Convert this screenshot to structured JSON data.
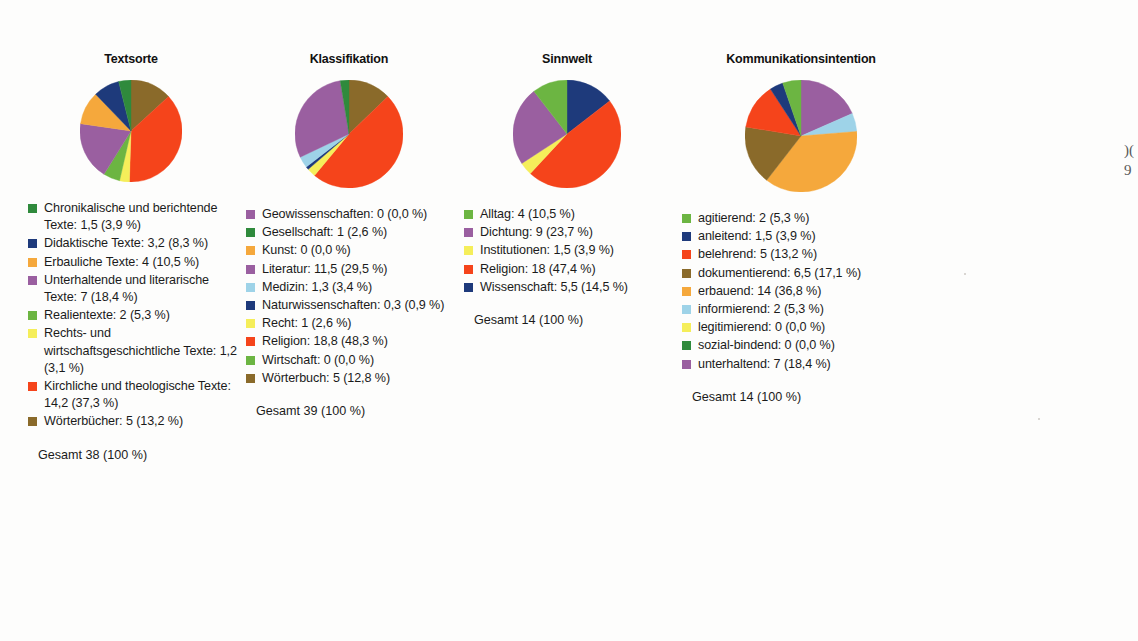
{
  "page": {
    "background_color": "#fdfdfc",
    "margin_note_line1": ")(",
    "margin_note_line2": "9"
  },
  "palette": {
    "green_dark": "#2f8a3c",
    "green_mid": "#3f9c35",
    "green_light": "#6cb542",
    "navy": "#1e3a7b",
    "orange": "#f5a83c",
    "purple": "#9a5fa0",
    "yellow": "#f5ee5a",
    "red": "#f5441b",
    "brown": "#8a6a2a",
    "lightblue": "#9ed3e8"
  },
  "charts": [
    {
      "id": "textsorte",
      "title": "Textsorte",
      "total_label": "Gesamt 38 (100 %)",
      "chart_data": {
        "type": "pie",
        "title": "Textsorte",
        "total": 38,
        "total_text": "Gesamt 38 (100 %)",
        "categories": [
          "Chronikalische und berichtende Texte",
          "Didaktische Texte",
          "Erbauliche Texte",
          "Unterhaltende und literarische Texte",
          "Realientexte",
          "Rechts- und wirtschaftsgeschichtliche Texte",
          "Kirchliche und theologische Texte",
          "Wörterbücher"
        ],
        "values": [
          1.5,
          3.2,
          4,
          7,
          2,
          1.2,
          14.2,
          5
        ],
        "percents": [
          3.9,
          8.3,
          10.5,
          18.4,
          5.3,
          3.1,
          37.3,
          13.2
        ]
      },
      "legend": [
        {
          "color": "#2f8a3c",
          "label": "Chronikalische und berichtende Texte: 1,5 (3,9 %)"
        },
        {
          "color": "#1e3a7b",
          "label": "Didaktische Texte: 3,2 (8,3 %)"
        },
        {
          "color": "#f5a83c",
          "label": "Erbauliche Texte: 4 (10,5 %)"
        },
        {
          "color": "#9a5fa0",
          "label": "Unterhaltende und literarische Texte: 7 (18,4 %)"
        },
        {
          "color": "#6cb542",
          "label": "Realientexte: 2 (5,3 %)"
        },
        {
          "color": "#f5ee5a",
          "label": "Rechts- und wirtschaftsgeschichtliche Texte: 1,2 (3,1 %)"
        },
        {
          "color": "#f5441b",
          "label": "Kirchliche und theologische Texte: 14,2 (37,3 %)"
        },
        {
          "color": "#8a6a2a",
          "label": "Wörterbücher: 5 (13,2 %)"
        }
      ],
      "slices": [
        {
          "color": "#8a6a2a",
          "percent": 13.2
        },
        {
          "color": "#f5441b",
          "percent": 37.3
        },
        {
          "color": "#f5ee5a",
          "percent": 3.1
        },
        {
          "color": "#6cb542",
          "percent": 5.3
        },
        {
          "color": "#9a5fa0",
          "percent": 18.4
        },
        {
          "color": "#f5a83c",
          "percent": 10.5
        },
        {
          "color": "#1e3a7b",
          "percent": 8.3
        },
        {
          "color": "#2f8a3c",
          "percent": 3.9
        }
      ]
    },
    {
      "id": "klassifikation",
      "title": "Klassifikation",
      "total_label": "Gesamt 39 (100 %)",
      "chart_data": {
        "type": "pie",
        "title": "Klassifikation",
        "total": 39,
        "total_text": "Gesamt 39 (100 %)",
        "categories": [
          "Geowissenschaften",
          "Gesellschaft",
          "Kunst",
          "Literatur",
          "Medizin",
          "Naturwissenschaften",
          "Recht",
          "Religion",
          "Wirtschaft",
          "Wörterbuch"
        ],
        "values": [
          0,
          1,
          0,
          11.5,
          1.3,
          0.3,
          1,
          18.8,
          0,
          5
        ],
        "percents": [
          0.0,
          2.6,
          0.0,
          29.5,
          3.4,
          0.9,
          2.6,
          48.3,
          0.0,
          12.8
        ]
      },
      "legend": [
        {
          "color": "#9a5fa0",
          "label": "Geowissenschaften: 0 (0,0 %)"
        },
        {
          "color": "#2f8a3c",
          "label": "Gesellschaft: 1 (2,6 %)"
        },
        {
          "color": "#f5a83c",
          "label": "Kunst: 0 (0,0 %)"
        },
        {
          "color": "#9a5fa0",
          "label": "Literatur: 11,5 (29,5 %)"
        },
        {
          "color": "#9ed3e8",
          "label": "Medizin: 1,3 (3,4 %)"
        },
        {
          "color": "#1e3a7b",
          "label": "Naturwissenschaften: 0,3 (0,9 %)"
        },
        {
          "color": "#f5ee5a",
          "label": "Recht: 1 (2,6 %)"
        },
        {
          "color": "#f5441b",
          "label": "Religion: 18,8 (48,3 %)"
        },
        {
          "color": "#6cb542",
          "label": "Wirtschaft: 0 (0,0 %)"
        },
        {
          "color": "#8a6a2a",
          "label": "Wörterbuch: 5 (12,8 %)"
        }
      ],
      "slices": [
        {
          "color": "#8a6a2a",
          "percent": 12.8
        },
        {
          "color": "#f5441b",
          "percent": 48.3
        },
        {
          "color": "#f5ee5a",
          "percent": 2.6
        },
        {
          "color": "#1e3a7b",
          "percent": 0.9
        },
        {
          "color": "#9ed3e8",
          "percent": 3.4
        },
        {
          "color": "#9a5fa0",
          "percent": 29.5
        },
        {
          "color": "#2f8a3c",
          "percent": 2.6
        }
      ]
    },
    {
      "id": "sinnwelt",
      "title": "Sinnwelt",
      "total_label": "Gesamt 14 (100 %)",
      "chart_data": {
        "type": "pie",
        "title": "Sinnwelt",
        "total": 14,
        "total_text": "Gesamt 14 (100 %)",
        "categories": [
          "Alltag",
          "Dichtung",
          "Institutionen",
          "Religion",
          "Wissenschaft"
        ],
        "values": [
          4,
          9,
          1.5,
          18,
          5.5
        ],
        "percents": [
          10.5,
          23.7,
          3.9,
          47.4,
          14.5
        ]
      },
      "legend": [
        {
          "color": "#6cb542",
          "label": "Alltag: 4 (10,5 %)"
        },
        {
          "color": "#9a5fa0",
          "label": "Dichtung: 9 (23,7 %)"
        },
        {
          "color": "#f5ee5a",
          "label": "Institutionen: 1,5 (3,9 %)"
        },
        {
          "color": "#f5441b",
          "label": "Religion: 18 (47,4 %)"
        },
        {
          "color": "#1e3a7b",
          "label": "Wissenschaft: 5,5 (14,5 %)"
        }
      ],
      "slices": [
        {
          "color": "#1e3a7b",
          "percent": 14.5
        },
        {
          "color": "#f5441b",
          "percent": 47.4
        },
        {
          "color": "#f5ee5a",
          "percent": 3.9
        },
        {
          "color": "#9a5fa0",
          "percent": 23.7
        },
        {
          "color": "#6cb542",
          "percent": 10.5
        }
      ]
    },
    {
      "id": "kommunikationsintention",
      "title": "Kommunikationsintention",
      "total_label": "Gesamt 14 (100 %)",
      "chart_data": {
        "type": "pie",
        "title": "Kommunikationsintention",
        "total": 14,
        "total_text": "Gesamt 14 (100 %)",
        "categories": [
          "agitierend",
          "anleitend",
          "belehrend",
          "dokumentierend",
          "erbauend",
          "informierend",
          "legitimierend",
          "sozial-bindend",
          "unterhaltend"
        ],
        "values": [
          2,
          1.5,
          5,
          6.5,
          14,
          2,
          0,
          0,
          7
        ],
        "percents": [
          5.3,
          3.9,
          13.2,
          17.1,
          36.8,
          5.3,
          0.0,
          0.0,
          18.4
        ]
      },
      "legend": [
        {
          "color": "#6cb542",
          "label": "agitierend: 2 (5,3 %)"
        },
        {
          "color": "#1e3a7b",
          "label": "anleitend: 1,5 (3,9 %)"
        },
        {
          "color": "#f5441b",
          "label": "belehrend: 5 (13,2 %)"
        },
        {
          "color": "#8a6a2a",
          "label": "dokumentierend: 6,5 (17,1 %)"
        },
        {
          "color": "#f5a83c",
          "label": "erbauend: 14 (36,8 %)"
        },
        {
          "color": "#9ed3e8",
          "label": "informierend: 2 (5,3 %)"
        },
        {
          "color": "#f5ee5a",
          "label": "legitimierend: 0 (0,0 %)"
        },
        {
          "color": "#2f8a3c",
          "label": "sozial-bindend: 0 (0,0 %)"
        },
        {
          "color": "#9a5fa0",
          "label": "unterhaltend: 7 (18,4 %)"
        }
      ],
      "slices": [
        {
          "color": "#9a5fa0",
          "percent": 18.4
        },
        {
          "color": "#9ed3e8",
          "percent": 5.3
        },
        {
          "color": "#f5a83c",
          "percent": 36.8
        },
        {
          "color": "#8a6a2a",
          "percent": 17.1
        },
        {
          "color": "#f5441b",
          "percent": 13.2
        },
        {
          "color": "#1e3a7b",
          "percent": 3.9
        },
        {
          "color": "#6cb542",
          "percent": 5.3
        }
      ]
    }
  ]
}
